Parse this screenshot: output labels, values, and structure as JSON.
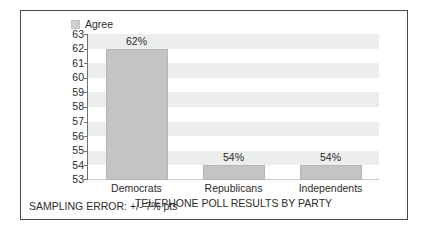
{
  "legend": {
    "entries": [
      {
        "label": "Agree",
        "color": "#cfcfcf",
        "swatch_icon": "legend-square-icon"
      }
    ]
  },
  "colors": {
    "bar_fill": "#c4c4c4",
    "band_fill": "#eceded",
    "plot_background": "#ffffff",
    "frame_border": "#45484b",
    "axis_line": "#6f7275",
    "text": "#2b2b2b"
  },
  "footnote": "SAMPLING ERROR: +/- 7% pts",
  "chart_data": {
    "type": "bar",
    "title": "TELEPHONE POLL RESULTS BY PARTY",
    "subtitle": "",
    "xlabel": "",
    "ylabel": "",
    "categories": [
      "Democrats",
      "Republicans",
      "Independents"
    ],
    "values": [
      62,
      54,
      54
    ],
    "data_labels": [
      "62%",
      "54%",
      "54%"
    ],
    "series": [
      {
        "name": "Agree",
        "values": [
          62,
          54,
          54
        ],
        "color": "#c4c4c4"
      }
    ],
    "ylim": [
      53,
      63
    ],
    "ytick_labels": [
      "63",
      "62",
      "61",
      "60",
      "59",
      "58",
      "57",
      "56",
      "55",
      "54",
      "53"
    ],
    "ytick_values": [
      63,
      62,
      61,
      60,
      59,
      58,
      57,
      56,
      55,
      54,
      53
    ],
    "grid": false,
    "banded_background": true,
    "legend_position": "top-left",
    "annotations": [
      "SAMPLING ERROR: +/- 7% pts"
    ]
  }
}
